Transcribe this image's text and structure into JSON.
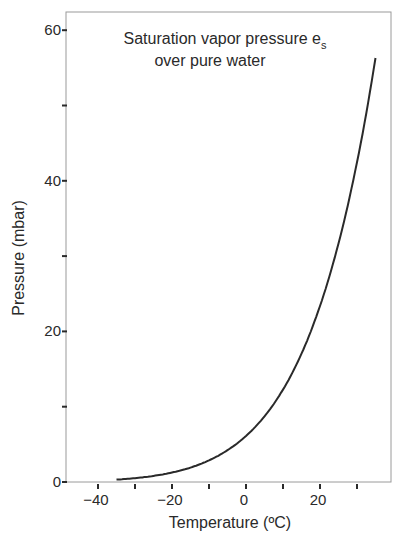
{
  "chart_data": {
    "type": "line",
    "title": "",
    "annotation": {
      "line1": "Saturation vapor pressure e",
      "subscript": "s",
      "line2": "over pure water"
    },
    "xlabel": "Temperature (ºC)",
    "ylabel": "Pressure (mbar)",
    "xlim": [
      -48,
      38
    ],
    "ylim": [
      0,
      63
    ],
    "x_ticks": [
      -40,
      -30,
      -20,
      -10,
      0,
      10,
      20,
      30
    ],
    "x_tick_labels": [
      "−40",
      "",
      "−20",
      "",
      "0",
      "",
      "20",
      ""
    ],
    "y_ticks": [
      0,
      10,
      20,
      30,
      40,
      50,
      60
    ],
    "y_tick_labels": [
      "0",
      "",
      "20",
      "",
      "40",
      "",
      "60"
    ],
    "grid": false,
    "legend": null,
    "series": [
      {
        "name": "Saturation vapor pressure over pure water",
        "color": "#2a2a2a",
        "x": [
          -35,
          -30,
          -25,
          -20,
          -15,
          -10,
          -5,
          0,
          5,
          10,
          15,
          20,
          25,
          30,
          35
        ],
        "y": [
          0.3,
          0.5,
          0.8,
          1.3,
          1.9,
          2.9,
          4.2,
          6.1,
          8.7,
          12.3,
          17.0,
          23.4,
          31.7,
          42.4,
          56.2
        ]
      }
    ]
  }
}
